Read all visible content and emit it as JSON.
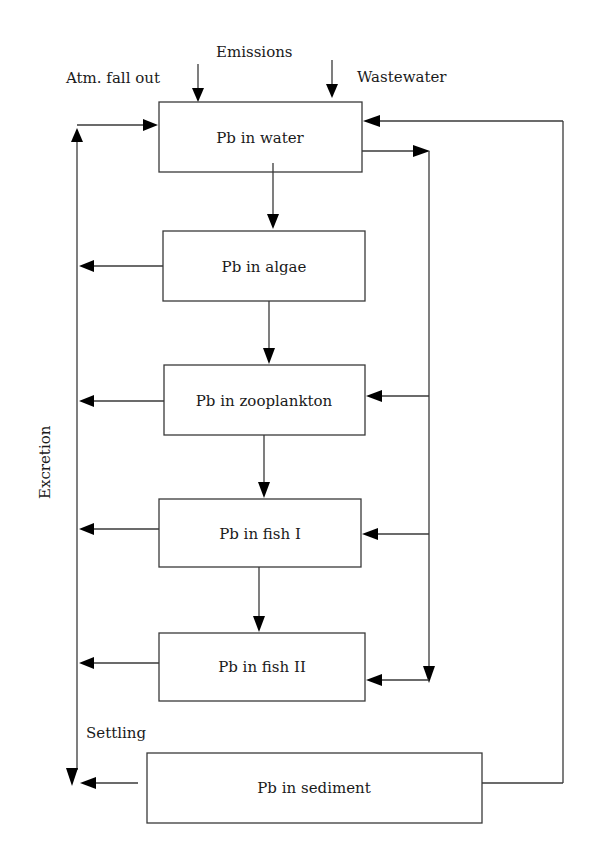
{
  "diagram": {
    "inputs": {
      "emissions": "Emissions",
      "atm_fall_out": "Atm. fall out",
      "wastewater": "Wastewater"
    },
    "compartments": [
      {
        "id": "water",
        "label": "Pb in water"
      },
      {
        "id": "algae",
        "label": "Pb in algae"
      },
      {
        "id": "zooplankton",
        "label": "Pb in zooplankton"
      },
      {
        "id": "fish1",
        "label": "Pb in fish I"
      },
      {
        "id": "fish2",
        "label": "Pb in fish II"
      },
      {
        "id": "sediment",
        "label": "Pb in sediment"
      }
    ],
    "flow_labels": {
      "excretion": "Excretion",
      "settling": "Settling"
    },
    "colors": {
      "line": "#3a3a3a",
      "arrowhead": "#000000",
      "text": "#1a1a1a",
      "background": "#ffffff"
    }
  }
}
